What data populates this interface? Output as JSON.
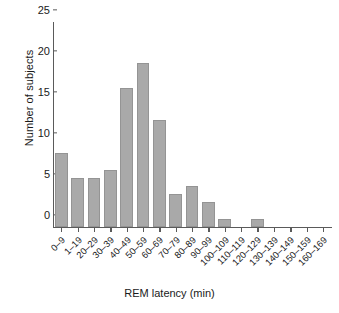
{
  "chart_data": {
    "type": "bar",
    "title": "",
    "subtitle": "",
    "xlabel": "REM latency (min)",
    "ylabel": "Number of subjects",
    "categories": [
      "0–9",
      "1–19",
      "20–29",
      "30–39",
      "40–49",
      "50–59",
      "60–69",
      "70–79",
      "80–89",
      "90–99",
      "100–109",
      "110–119",
      "120–129",
      "130–139",
      "140–149",
      "150–159",
      "160–169"
    ],
    "values": [
      9,
      6,
      6,
      7,
      17,
      20,
      13,
      4,
      5,
      3,
      1,
      0,
      1,
      0,
      0,
      0,
      0
    ],
    "ylim": [
      0,
      25
    ],
    "yticks": [
      0,
      5,
      10,
      15,
      20,
      25
    ],
    "ytick_labels": [
      "0",
      "5",
      "10",
      "15",
      "20",
      "25"
    ],
    "grid": false,
    "legend": false,
    "legend_position": "none",
    "bar_color": "#a9a9a9",
    "bar_edge_color": "#949494",
    "axis_color": "#5a5a5a",
    "background_color": "#ffffff"
  }
}
